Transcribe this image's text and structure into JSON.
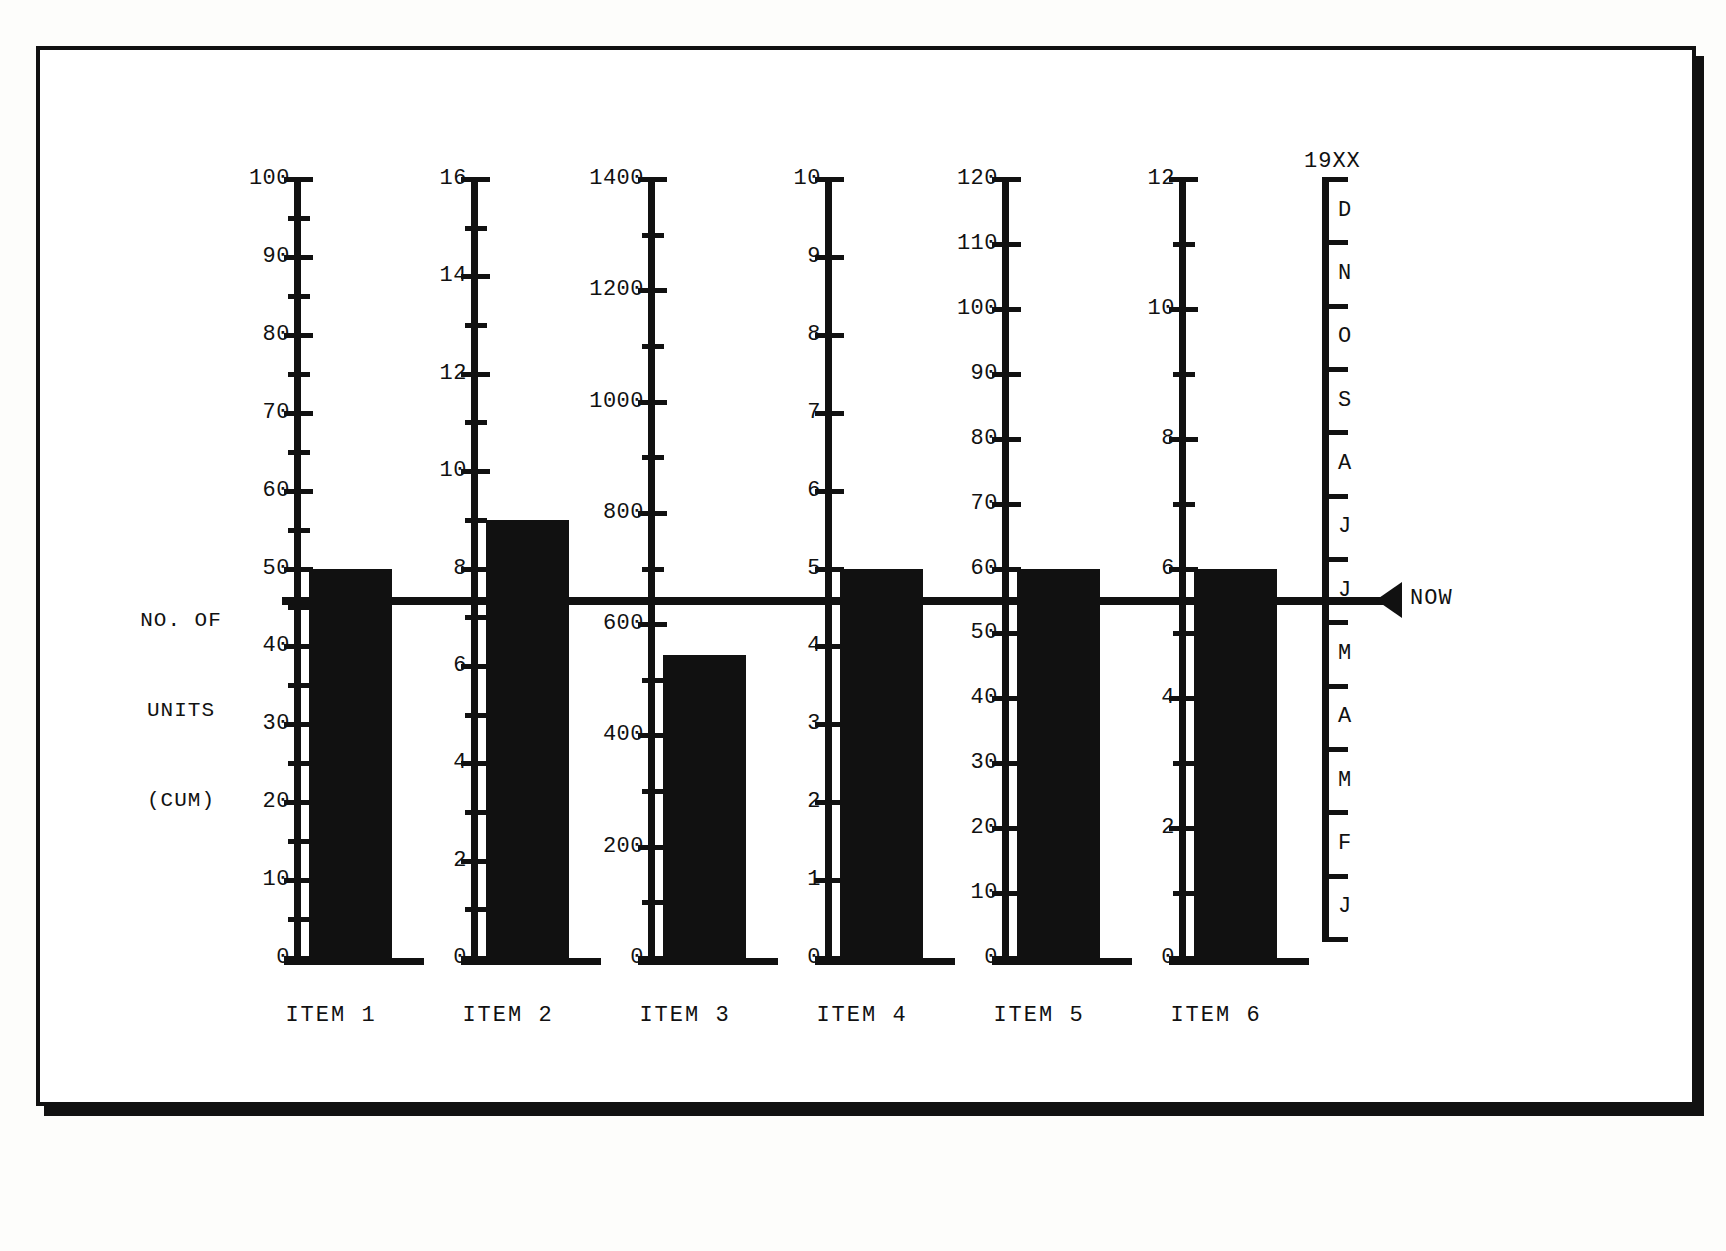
{
  "chart_data": {
    "type": "bar",
    "title": "",
    "ylabel": "NO. OF UNITS (CUM)",
    "xlabel": "",
    "grid": false,
    "legend": "none",
    "annotations": [
      {
        "name": "now-marker",
        "label": "NOW",
        "description": "horizontal line across all scales marking the current planned level"
      },
      {
        "name": "year-label",
        "label": "19XX"
      }
    ],
    "categories": [
      "ITEM 1",
      "ITEM 2",
      "ITEM 3",
      "ITEM 4",
      "ITEM 5",
      "ITEM 6"
    ],
    "values": [
      50,
      9,
      545,
      5,
      60,
      6
    ],
    "plan_levels": [
      50,
      8,
      700,
      5,
      60,
      6
    ],
    "axes": [
      {
        "category": "ITEM 1",
        "ylim": [
          0,
          100
        ],
        "major_step": 10,
        "minor_step": 5,
        "tick_labels": [
          "100",
          "90",
          "80",
          "70",
          "60",
          "50",
          "40",
          "30",
          "20",
          "10",
          "0"
        ],
        "bar_value": 50,
        "plan_value": 50
      },
      {
        "category": "ITEM 2",
        "ylim": [
          0,
          16
        ],
        "major_step": 2,
        "minor_step": 1,
        "tick_labels": [
          "16",
          "14",
          "12",
          "10",
          "8",
          "6",
          "4",
          "2",
          "0"
        ],
        "bar_value": 9,
        "plan_value": 8
      },
      {
        "category": "ITEM 3",
        "ylim": [
          0,
          1400
        ],
        "major_step": 200,
        "minor_step": 100,
        "tick_labels": [
          "1400",
          "1200",
          "1000",
          "800",
          "600",
          "400",
          "200",
          "0"
        ],
        "bar_value": 545,
        "plan_value": 700
      },
      {
        "category": "ITEM 4",
        "ylim": [
          0,
          10
        ],
        "major_step": 1,
        "minor_step": 0,
        "tick_labels": [
          "10",
          "9",
          "8",
          "7",
          "6",
          "5",
          "4",
          "3",
          "2",
          "1",
          "0"
        ],
        "bar_value": 5,
        "plan_value": 5
      },
      {
        "category": "ITEM 5",
        "ylim": [
          0,
          120
        ],
        "major_step": 10,
        "minor_step": 0,
        "tick_labels": [
          "120",
          "110",
          "100",
          "90",
          "80",
          "70",
          "60",
          "50",
          "40",
          "30",
          "20",
          "10",
          "0"
        ],
        "bar_value": 60,
        "plan_value": 60
      },
      {
        "category": "ITEM 6",
        "ylim": [
          0,
          12
        ],
        "major_step": 2,
        "minor_step": 1,
        "tick_labels": [
          "12",
          "10",
          "8",
          "6",
          "4",
          "2",
          "0"
        ],
        "bar_value": 6,
        "plan_value": 6
      }
    ],
    "time_axis": {
      "year": "19XX",
      "direction": "top-is-latest",
      "months": [
        "D",
        "N",
        "O",
        "S",
        "A",
        "J",
        "J",
        "M",
        "A",
        "M",
        "F",
        "J"
      ],
      "now_between": [
        "J",
        "J"
      ]
    }
  },
  "labels": {
    "y_caption_line1": "NO. OF",
    "y_caption_line2": "UNITS",
    "y_caption_line3": "(CUM)",
    "now": "NOW",
    "year": "19XX"
  }
}
